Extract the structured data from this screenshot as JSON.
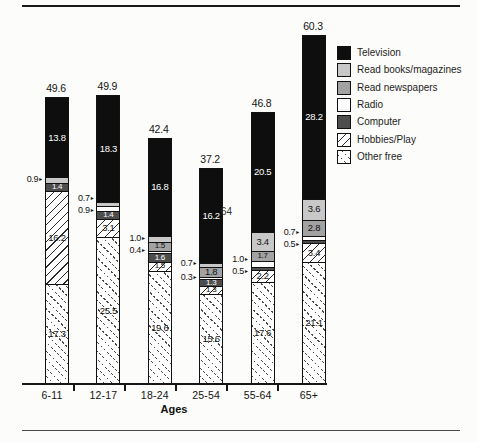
{
  "chart_data": {
    "type": "bar",
    "stacked": true,
    "stack_order": "top-to-bottom",
    "title": "",
    "xlabel": "Ages",
    "ylabel": "",
    "grid": false,
    "legend_position": "right",
    "categories": [
      "6-11",
      "12-17",
      "18-24",
      "25-54",
      "55-64",
      "65+"
    ],
    "series": [
      {
        "name": "Television",
        "fill": "#0e0e0e",
        "pattern": null,
        "label_color": "#ffffff",
        "values": [
          13.8,
          18.3,
          16.8,
          16.2,
          20.5,
          28.2
        ]
      },
      {
        "name": "Read books/magazines",
        "fill": "#c8c8c8",
        "pattern": null,
        "label_color": "#111111",
        "values": [
          0.9,
          0.7,
          1.0,
          0.7,
          3.4,
          3.6
        ]
      },
      {
        "name": "Read newspapers",
        "fill": "#a2a2a2",
        "pattern": null,
        "label_color": "#111111",
        "values": [
          0,
          0,
          1.5,
          1.8,
          1.7,
          2.8
        ]
      },
      {
        "name": "Radio",
        "fill": "#ffffff",
        "pattern": null,
        "label_color": "#111111",
        "values": [
          0,
          0.9,
          0.4,
          0.3,
          1.0,
          0.7
        ]
      },
      {
        "name": "Computer",
        "fill": "#4d4d4d",
        "pattern": null,
        "label_color": "#ffffff",
        "values": [
          1.4,
          1.4,
          1.6,
          1.3,
          0.5,
          0.5
        ]
      },
      {
        "name": "Hobbies/Play",
        "fill": null,
        "pattern": "hatch-forward",
        "label_color": "#111111",
        "values": [
          16.2,
          3.1,
          1.5,
          1.3,
          2.2,
          3.4
        ]
      },
      {
        "name": "Other free",
        "fill": null,
        "pattern": "hatch-back-dotted",
        "label_color": "#111111",
        "values": [
          17.3,
          25.5,
          19.6,
          15.6,
          17.6,
          21.1
        ]
      }
    ],
    "totals": [
      49.6,
      49.9,
      42.4,
      37.2,
      46.8,
      60.3
    ]
  },
  "legend": {
    "items": [
      "Television",
      "Read books/magazines",
      "Read newspapers",
      "Radio",
      "Computer",
      "Hobbies/Play",
      "Other free"
    ]
  },
  "annotations": {
    "stray_text": "64"
  },
  "colors": {
    "background": "#fcfcfa",
    "television": "#0e0e0e",
    "read_books": "#c8c8c8",
    "read_newspapers": "#a2a2a2",
    "radio": "#ffffff",
    "computer": "#4d4d4d",
    "rule": "#1a1a1a"
  }
}
